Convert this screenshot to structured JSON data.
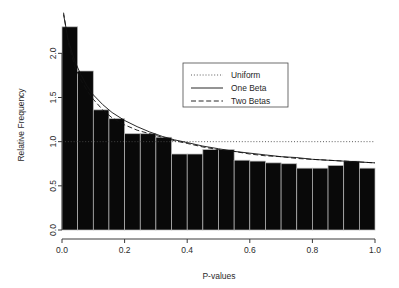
{
  "chart_data": {
    "type": "bar",
    "title": "",
    "subtitle": "",
    "xlabel": "P-values",
    "ylabel": "Relative Frequency",
    "xlim": [
      0.0,
      1.0
    ],
    "ylim": [
      0.0,
      2.4
    ],
    "grid": false,
    "bin_width": 0.05,
    "categories": [
      "0.00-0.05",
      "0.05-0.10",
      "0.10-0.15",
      "0.15-0.20",
      "0.20-0.25",
      "0.25-0.30",
      "0.30-0.35",
      "0.35-0.40",
      "0.40-0.45",
      "0.45-0.50",
      "0.50-0.55",
      "0.55-0.60",
      "0.60-0.65",
      "0.65-0.70",
      "0.70-0.75",
      "0.75-0.80",
      "0.80-0.85",
      "0.85-0.90",
      "0.90-0.95",
      "0.95-1.00"
    ],
    "bin_centers": [
      0.025,
      0.075,
      0.125,
      0.175,
      0.225,
      0.275,
      0.325,
      0.375,
      0.425,
      0.475,
      0.525,
      0.575,
      0.625,
      0.675,
      0.725,
      0.775,
      0.825,
      0.875,
      0.925,
      0.975
    ],
    "values": [
      2.3,
      1.8,
      1.36,
      1.26,
      1.09,
      1.09,
      1.05,
      0.86,
      0.86,
      0.91,
      0.91,
      0.79,
      0.78,
      0.76,
      0.75,
      0.7,
      0.7,
      0.73,
      0.78,
      0.7
    ],
    "xticks": [
      0.0,
      0.2,
      0.4,
      0.6,
      0.8,
      1.0
    ],
    "xticklabels": [
      "0.0",
      "0.2",
      "0.4",
      "0.6",
      "0.8",
      "1.0"
    ],
    "yticks": [
      0.0,
      0.5,
      1.0,
      1.5,
      2.0
    ],
    "yticklabels": [
      "0.0",
      "0.5",
      "1.0",
      "1.5",
      "2.0"
    ],
    "legend_position": "top-center-right",
    "legend": [
      {
        "name": "Uniform",
        "style": "dotted"
      },
      {
        "name": "One Beta",
        "style": "solid"
      },
      {
        "name": "Two Betas",
        "style": "dashed"
      }
    ],
    "series": [
      {
        "name": "Uniform",
        "style": "dotted",
        "x": [
          0.0,
          1.0
        ],
        "values": [
          1.0,
          1.0
        ]
      },
      {
        "name": "One Beta",
        "style": "solid",
        "x": [
          0.005,
          0.02,
          0.04,
          0.06,
          0.08,
          0.1,
          0.13,
          0.16,
          0.2,
          0.24,
          0.28,
          0.32,
          0.36,
          0.4,
          0.45,
          0.5,
          0.55,
          0.6,
          0.65,
          0.7,
          0.75,
          0.8,
          0.85,
          0.9,
          0.95,
          1.0
        ],
        "values": [
          2.44,
          2.15,
          1.92,
          1.76,
          1.63,
          1.53,
          1.42,
          1.33,
          1.24,
          1.17,
          1.11,
          1.06,
          1.02,
          0.99,
          0.95,
          0.92,
          0.89,
          0.87,
          0.85,
          0.83,
          0.82,
          0.8,
          0.79,
          0.78,
          0.77,
          0.76
        ]
      },
      {
        "name": "Two Betas",
        "style": "dashed",
        "x": [
          0.005,
          0.02,
          0.04,
          0.06,
          0.08,
          0.1,
          0.13,
          0.16,
          0.2,
          0.24,
          0.28,
          0.32,
          0.36,
          0.4,
          0.45,
          0.5,
          0.55,
          0.6,
          0.65,
          0.7,
          0.75,
          0.8,
          0.85,
          0.9,
          0.95,
          1.0
        ],
        "values": [
          2.46,
          2.12,
          1.86,
          1.7,
          1.58,
          1.48,
          1.36,
          1.27,
          1.19,
          1.13,
          1.09,
          1.05,
          1.01,
          0.98,
          0.94,
          0.91,
          0.89,
          0.86,
          0.84,
          0.83,
          0.81,
          0.8,
          0.79,
          0.78,
          0.77,
          0.76
        ]
      }
    ]
  }
}
